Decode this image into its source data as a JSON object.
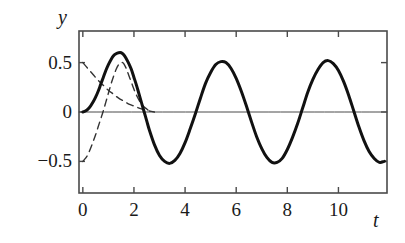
{
  "figure": {
    "background_color": "#ffffff",
    "curve_color": "#111111",
    "axis_color": "#4a4a4a",
    "dashed_color": "#333333"
  },
  "axes": {
    "y_axis_name": "y",
    "x_axis_name": "t",
    "y_tick_labels": [
      "0.5",
      "0",
      "−0.5"
    ],
    "y_tick_values": [
      0.5,
      0,
      -0.5
    ],
    "x_tick_labels": [
      "0",
      "2",
      "4",
      "6",
      "8",
      "10"
    ],
    "x_tick_values": [
      0,
      2,
      4,
      6,
      8,
      10
    ],
    "x_range": [
      -0.15,
      11.9
    ],
    "y_range": [
      -0.82,
      0.82
    ],
    "frame": "box",
    "grid": "off",
    "ticks_direction": "inward"
  },
  "chart_data": {
    "type": "line",
    "title": "",
    "xlabel": "t",
    "ylabel": "y",
    "xlim": [
      -0.15,
      11.9
    ],
    "ylim": [
      -0.82,
      0.82
    ],
    "grid": false,
    "legend": "none",
    "series": [
      {
        "name": "total-solution",
        "style": "solid",
        "linewidth": 3,
        "color": "#111111",
        "description": "Steady oscillation of amplitude 0.5 and period about 3.15, with a slightly larger first peak near 0.6 at t=1.5 due to the transient.",
        "x": [
          0,
          0.1,
          0.2,
          0.3,
          0.4,
          0.5,
          0.6,
          0.7,
          0.8,
          0.9,
          1.0,
          1.1,
          1.2,
          1.3,
          1.4,
          1.5,
          1.6,
          1.7,
          1.8,
          1.9,
          2.0,
          2.1,
          2.2,
          2.3,
          2.4,
          2.5,
          2.6,
          2.8,
          3.0,
          3.2,
          3.4,
          3.6,
          3.8,
          4.0,
          4.2,
          4.4,
          4.6,
          4.8,
          5.0,
          5.2,
          5.4,
          5.6,
          5.8,
          6.0,
          6.2,
          6.4,
          6.6,
          6.8,
          7.0,
          7.2,
          7.4,
          7.6,
          7.8,
          8.0,
          8.2,
          8.4,
          8.6,
          8.8,
          9.0,
          9.2,
          9.4,
          9.6,
          9.8,
          10.0,
          10.2,
          10.4,
          10.6,
          10.8,
          11.0,
          11.2,
          11.4,
          11.6,
          11.8
        ],
        "y": [
          0.0,
          0.01,
          0.03,
          0.06,
          0.1,
          0.15,
          0.21,
          0.28,
          0.35,
          0.42,
          0.48,
          0.53,
          0.57,
          0.59,
          0.6,
          0.6,
          0.58,
          0.54,
          0.49,
          0.43,
          0.35,
          0.27,
          0.18,
          0.09,
          0.0,
          -0.09,
          -0.18,
          -0.33,
          -0.44,
          -0.5,
          -0.52,
          -0.49,
          -0.42,
          -0.31,
          -0.17,
          -0.02,
          0.14,
          0.29,
          0.4,
          0.48,
          0.51,
          0.5,
          0.44,
          0.34,
          0.21,
          0.06,
          -0.1,
          -0.25,
          -0.37,
          -0.46,
          -0.51,
          -0.51,
          -0.47,
          -0.38,
          -0.26,
          -0.12,
          0.04,
          0.2,
          0.33,
          0.43,
          0.5,
          0.52,
          0.49,
          0.42,
          0.31,
          0.17,
          0.01,
          -0.15,
          -0.29,
          -0.4,
          -0.47,
          -0.51,
          -0.5
        ]
      },
      {
        "name": "transient-decaying-component",
        "style": "dashed",
        "linewidth": 1.4,
        "color": "#333333",
        "description": "Starts at +0.5 at t=0 and decays monotonically toward zero by about t=2.7.",
        "x": [
          0,
          0.2,
          0.4,
          0.6,
          0.8,
          1.0,
          1.2,
          1.4,
          1.6,
          1.8,
          2.0,
          2.2,
          2.4,
          2.6,
          2.8
        ],
        "y": [
          0.5,
          0.44,
          0.38,
          0.32,
          0.27,
          0.22,
          0.18,
          0.14,
          0.11,
          0.08,
          0.06,
          0.04,
          0.02,
          0.01,
          0.0
        ]
      },
      {
        "name": "transient-rising-component",
        "style": "dashed",
        "linewidth": 1.4,
        "color": "#333333",
        "description": "Starts at -0.5 at t=0, rises steeply through zero near t=0.8, peaks near 0.5 at t=1.55, then falls back toward zero by about t=2.7.",
        "x": [
          0,
          0.1,
          0.2,
          0.3,
          0.4,
          0.5,
          0.6,
          0.7,
          0.8,
          0.9,
          1.0,
          1.1,
          1.2,
          1.3,
          1.4,
          1.5,
          1.55,
          1.6,
          1.7,
          1.8,
          1.9,
          2.0,
          2.1,
          2.2,
          2.3,
          2.4,
          2.5,
          2.6,
          2.7
        ],
        "y": [
          -0.5,
          -0.47,
          -0.43,
          -0.37,
          -0.3,
          -0.23,
          -0.15,
          -0.07,
          0.01,
          0.1,
          0.19,
          0.28,
          0.36,
          0.43,
          0.48,
          0.5,
          0.5,
          0.49,
          0.44,
          0.37,
          0.3,
          0.23,
          0.17,
          0.12,
          0.08,
          0.05,
          0.03,
          0.01,
          0.0
        ]
      },
      {
        "name": "zero-baseline",
        "style": "solid",
        "linewidth": 1,
        "color": "#4a4a4a",
        "description": "Horizontal axis line at y = 0.",
        "x": [
          -0.15,
          11.9
        ],
        "y": [
          0,
          0
        ]
      }
    ]
  }
}
